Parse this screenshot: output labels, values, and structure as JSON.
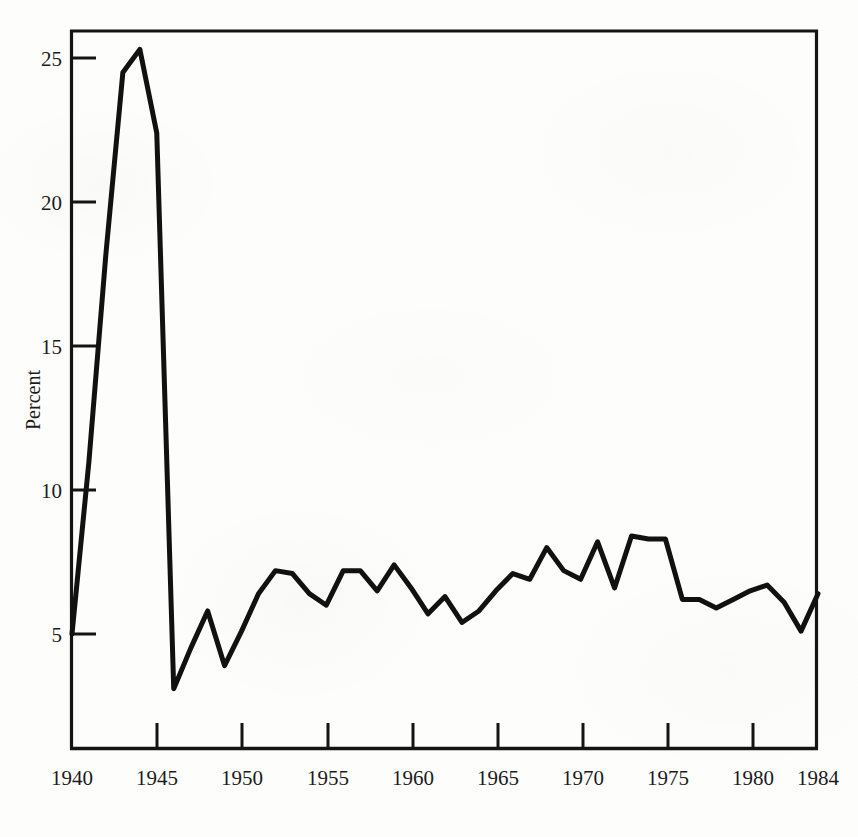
{
  "figure": {
    "background_color": "#fdfdfb",
    "ink_color": "#111111",
    "caption_fragment": ""
  },
  "chart_data": {
    "type": "line",
    "title": "",
    "subtitle": "",
    "xlabel": "",
    "ylabel": "Percent",
    "xlim": [
      1940,
      1984
    ],
    "ylim": [
      2.2,
      26.6
    ],
    "grid": false,
    "legend": null,
    "axis_ticks": {
      "x_major": [
        1940,
        1945,
        1950,
        1955,
        1960,
        1965,
        1970,
        1975,
        1980,
        1984
      ],
      "x_tick_labels": [
        "1940",
        "1945",
        "1950",
        "1955",
        "1960",
        "1965",
        "1970",
        "1975",
        "1980",
        "1984"
      ],
      "y_major": [
        5,
        10,
        15,
        20,
        25
      ],
      "y_tick_labels": [
        "5",
        "10",
        "15",
        "20",
        "25"
      ]
    },
    "x": [
      1940,
      1941,
      1942,
      1943,
      1944,
      1945,
      1946,
      1947,
      1948,
      1949,
      1950,
      1951,
      1952,
      1953,
      1954,
      1955,
      1956,
      1957,
      1958,
      1959,
      1960,
      1961,
      1962,
      1963,
      1964,
      1965,
      1966,
      1967,
      1968,
      1969,
      1970,
      1971,
      1972,
      1973,
      1974,
      1975,
      1976,
      1977,
      1978,
      1979,
      1980,
      1981,
      1982,
      1983,
      1984
    ],
    "values": [
      5.0,
      11.0,
      18.2,
      24.5,
      25.3,
      22.4,
      3.1,
      4.5,
      5.8,
      3.9,
      5.1,
      6.4,
      7.2,
      7.1,
      6.4,
      6.0,
      7.2,
      7.2,
      6.5,
      7.4,
      6.6,
      5.7,
      6.3,
      5.4,
      5.8,
      6.5,
      7.1,
      6.9,
      8.0,
      7.2,
      6.9,
      8.2,
      6.6,
      8.4,
      8.3,
      8.3,
      6.2,
      6.2,
      5.9,
      6.2,
      6.5,
      6.7,
      6.1,
      5.1,
      6.4
    ],
    "series": [
      {
        "name": "Percent",
        "values": [
          5.0,
          11.0,
          18.2,
          24.5,
          25.3,
          22.4,
          3.1,
          4.5,
          5.8,
          3.9,
          5.1,
          6.4,
          7.2,
          7.1,
          6.4,
          6.0,
          7.2,
          7.2,
          6.5,
          7.4,
          6.6,
          5.7,
          6.3,
          5.4,
          5.8,
          6.5,
          7.1,
          6.9,
          8.0,
          7.2,
          6.9,
          8.2,
          6.6,
          8.4,
          8.3,
          8.3,
          6.2,
          6.2,
          5.9,
          6.2,
          6.5,
          6.7,
          6.1,
          5.1,
          6.4
        ]
      }
    ]
  }
}
